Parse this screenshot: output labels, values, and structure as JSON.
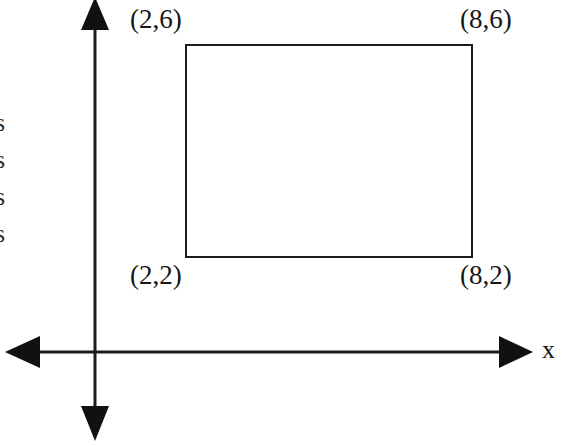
{
  "figure": {
    "background_color": "#ffffff",
    "ink_color": "#161616",
    "axes": {
      "x_axis_label": "x",
      "origin": {
        "x": 95,
        "y": 352
      },
      "x_axis": {
        "left_end": {
          "x": 6,
          "y": 352
        },
        "right_end": {
          "x": 532,
          "y": 352
        },
        "left_arrowhead": true,
        "right_arrowhead": true
      },
      "y_axis": {
        "top_end": {
          "x": 95,
          "y": 2
        },
        "bottom_end": {
          "x": 95,
          "y": 440
        },
        "top_arrowhead": true,
        "bottom_arrowhead": true
      }
    },
    "rectangle": {
      "left_px": 186,
      "top_px": 45,
      "right_px": 472,
      "bottom_px": 257,
      "stroke_color": "#1c1c1c",
      "stroke_width": 2,
      "fill": "none",
      "corner_points": [
        {
          "name": "top-left",
          "label": "(2,6)",
          "data_x": 2,
          "data_y": 6
        },
        {
          "name": "top-right",
          "label": "(8,6)",
          "data_x": 8,
          "data_y": 6
        },
        {
          "name": "bottom-left",
          "label": "(2,2)",
          "data_x": 2,
          "data_y": 2
        },
        {
          "name": "bottom-right",
          "label": "(8,2)",
          "data_x": 8,
          "data_y": 2
        }
      ]
    },
    "labels": {
      "top_left": "(2,6)",
      "top_right": "(8,6)",
      "bottom_left": "(2,2)",
      "bottom_right": "(8,2)"
    },
    "margin_text_fragments": [
      "s",
      "s",
      "s",
      "s"
    ]
  }
}
